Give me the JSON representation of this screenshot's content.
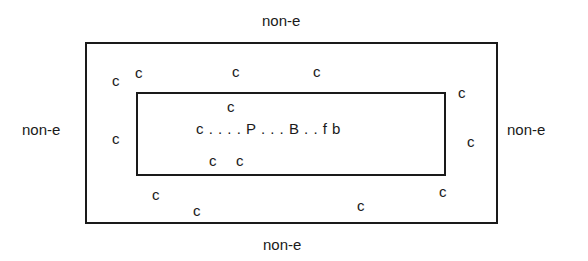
{
  "diagram": {
    "outer_labels": {
      "top": "non-e",
      "left": "non-e",
      "right": "non-e",
      "bottom": "non-e"
    },
    "center_sequence": "c . . . . P . . . B . . f b",
    "consonant_label": "c",
    "outer_ring_cs": [
      {
        "x": 112,
        "y": 73
      },
      {
        "x": 135,
        "y": 65
      },
      {
        "x": 232,
        "y": 64
      },
      {
        "x": 313,
        "y": 64
      },
      {
        "x": 458,
        "y": 85
      },
      {
        "x": 112,
        "y": 131
      },
      {
        "x": 467,
        "y": 134
      },
      {
        "x": 152,
        "y": 187
      },
      {
        "x": 193,
        "y": 203
      },
      {
        "x": 357,
        "y": 198
      },
      {
        "x": 439,
        "y": 184
      }
    ],
    "inner_cs": [
      {
        "x": 227,
        "y": 99
      },
      {
        "x": 209,
        "y": 153
      },
      {
        "x": 236,
        "y": 153
      }
    ]
  }
}
